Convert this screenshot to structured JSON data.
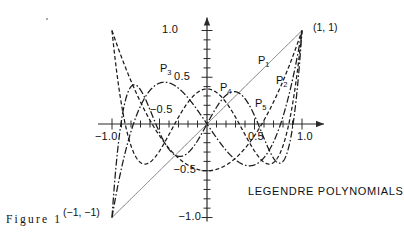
{
  "figure": {
    "number_label": "Figure 1",
    "title": "LEGENDRE POLYNOMIALS"
  },
  "annotations": {
    "top_right_point": "(1, 1)",
    "bottom_left_point": "(−1, −1)"
  },
  "axes": {
    "x_tick_labels": [
      {
        "value": -1.0,
        "text": "−1.0"
      },
      {
        "value": 0.5,
        "text": "0.5"
      },
      {
        "value": 1.0,
        "text": "1.0"
      }
    ],
    "y_tick_labels": [
      {
        "value": 1.0,
        "text": "1.0"
      },
      {
        "value": 0.5,
        "text": "0.5"
      },
      {
        "value": -0.5,
        "text": "−0.5"
      },
      {
        "value": -1.0,
        "text": "−1.0"
      }
    ],
    "inner_label": {
      "value": -0.5,
      "text": "−0.5"
    },
    "x_range": [
      -1.0,
      1.0
    ],
    "y_range": [
      -1.0,
      1.0
    ],
    "minor_tick_step": 0.1
  },
  "chart_data": {
    "type": "line",
    "title": "LEGENDRE POLYNOMIALS",
    "xlabel": "",
    "ylabel": "",
    "xlim": [
      -1.0,
      1.0
    ],
    "ylim": [
      -1.0,
      1.0
    ],
    "grid": false,
    "legend": "inline-curve-labels",
    "x_ticks": [
      -1.0,
      -0.9,
      -0.8,
      -0.7,
      -0.6,
      -0.5,
      -0.4,
      -0.3,
      -0.2,
      -0.1,
      0.0,
      0.1,
      0.2,
      0.3,
      0.4,
      0.5,
      0.6,
      0.7,
      0.8,
      0.9,
      1.0
    ],
    "y_ticks": [
      -1.0,
      -0.9,
      -0.8,
      -0.7,
      -0.6,
      -0.5,
      -0.4,
      -0.3,
      -0.2,
      -0.1,
      0.0,
      0.1,
      0.2,
      0.3,
      0.4,
      0.5,
      0.6,
      0.7,
      0.8,
      0.9,
      1.0
    ],
    "series": [
      {
        "name": "P1",
        "label": "P",
        "sub": "1",
        "degree": 1,
        "dash": "solid",
        "color": "#6b6b6b",
        "label_xy": [
          0.55,
          0.66
        ],
        "endpoints": [
          [
            -1,
            -1
          ],
          [
            1,
            1
          ]
        ]
      },
      {
        "name": "P2",
        "label": "P",
        "sub": "2",
        "degree": 2,
        "dash": "dash",
        "color": "#1a1a1a",
        "label_xy": [
          0.76,
          0.45
        ],
        "endpoints": [
          [
            -1,
            1
          ],
          [
            1,
            1
          ]
        ]
      },
      {
        "name": "P3",
        "label": "P",
        "sub": "3",
        "degree": 3,
        "dash": "dashdot",
        "color": "#1a1a1a",
        "label_xy": [
          -0.46,
          0.58
        ],
        "endpoints": [
          [
            -1,
            -1
          ],
          [
            1,
            1
          ]
        ]
      },
      {
        "name": "P4",
        "label": "P",
        "sub": "4",
        "degree": 4,
        "dash": "dash",
        "color": "#1a1a1a",
        "label_xy": [
          0.18,
          0.37
        ],
        "endpoints": [
          [
            -1,
            1
          ],
          [
            1,
            1
          ]
        ]
      },
      {
        "name": "P5",
        "label": "P",
        "sub": "5",
        "degree": 5,
        "dash": "dashdot",
        "color": "#1a1a1a",
        "label_xy": [
          0.56,
          0.2
        ],
        "endpoints": [
          [
            -1,
            -1
          ],
          [
            1,
            1
          ]
        ]
      }
    ]
  },
  "geometry": {
    "x0_px": 207,
    "y0_px": 124,
    "x_unit_px": 95,
    "y_unit_px": 93.5
  }
}
